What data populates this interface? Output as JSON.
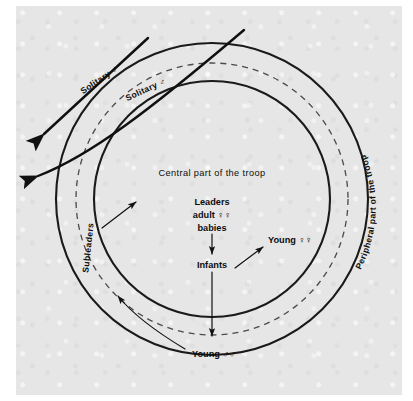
{
  "figure": {
    "name": "troop-structure-diagram",
    "background_color": "#e6e6e6",
    "page_color": "#e6e6e6",
    "ink_color": "#111111"
  },
  "labels": {
    "center_title": "Central part of the troop",
    "leaders": "Leaders",
    "adult_females": "adult ♀♀",
    "babies": "babies",
    "infants": "Infants",
    "young_females": "Young ♀♀",
    "young_males": "Young ♂♂",
    "subleaders": "Subleaders",
    "peripheral": "Peripheral part of the troop",
    "solitary_male_outer": "Solitary ♂",
    "solitary_male_inner": "Solitary ♂"
  },
  "geometry": {
    "center_x": 212,
    "center_y": 199,
    "outer_radius": 156,
    "dashed_radius": 136,
    "inner_radius": 118
  },
  "rings": [
    {
      "name": "outer-troop-boundary",
      "style": "solid",
      "radius": 156
    },
    {
      "name": "peripheral-dashed-boundary",
      "style": "dashed",
      "radius": 136
    },
    {
      "name": "central-core-boundary",
      "style": "solid",
      "radius": 118
    }
  ],
  "arrows": [
    {
      "name": "subleaders-arrow",
      "from": "Subleaders",
      "to": "central part"
    },
    {
      "name": "babies-to-infants-arrow",
      "from": "babies",
      "to": "Infants"
    },
    {
      "name": "infants-to-young-females-arrow",
      "from": "Infants",
      "to": "Young ♀♀"
    },
    {
      "name": "infants-to-periphery-arrow",
      "from": "Infants",
      "to": "peripheral ring"
    },
    {
      "name": "young-males-arrow",
      "from": "Young ♂♂",
      "to": "peripheral ring"
    },
    {
      "name": "solitary-male-exit-arrow-upper",
      "from": "troop",
      "to": "outside"
    },
    {
      "name": "solitary-male-exit-arrow-lower",
      "from": "troop",
      "to": "outside"
    }
  ]
}
